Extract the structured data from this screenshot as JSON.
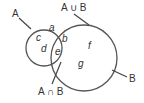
{
  "diagram": {
    "type": "venn",
    "sets": [
      {
        "name": "A",
        "label": "A",
        "elements_only": [
          "a",
          "c",
          "d"
        ]
      },
      {
        "name": "B",
        "label": "B",
        "elements_only": [
          "f",
          "g"
        ]
      }
    ],
    "intersection_elements": [
      "b",
      "e"
    ],
    "labels": {
      "set_a": "A",
      "set_b": "B",
      "union": "A ∪ B",
      "intersection": "A ∩ B"
    },
    "elements": {
      "a": "a",
      "b": "b",
      "c": "c",
      "d": "d",
      "e": "e",
      "f": "f",
      "g": "g"
    },
    "colors": {
      "stroke": "#555555",
      "text": "#333333",
      "background": "#ffffff"
    }
  }
}
